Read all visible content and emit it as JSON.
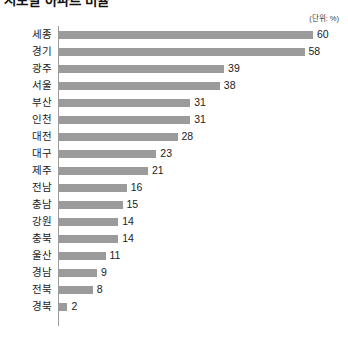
{
  "title": "시도별 아파트 비율",
  "unit_label": "(단위: %)",
  "axis": {
    "baseline_value": 0,
    "max_value": 60
  },
  "colors": {
    "bar": "#9b9b9b",
    "axis": "#9a9a9a",
    "text": "#1b1b1b",
    "background": "#ffffff"
  },
  "chart_data": {
    "type": "bar",
    "orientation": "horizontal",
    "title": "시도별 아파트 비율",
    "xlabel": "",
    "ylabel": "",
    "unit": "%",
    "grid": false,
    "legend": false,
    "xlim": [
      0,
      60
    ],
    "categories": [
      "세종",
      "경기",
      "광주",
      "서울",
      "부산",
      "인천",
      "대전",
      "대구",
      "제주",
      "전남",
      "충남",
      "강원",
      "충북",
      "울산",
      "경남",
      "전북",
      "경북"
    ],
    "values": [
      60,
      58,
      39,
      38,
      31,
      31,
      28,
      23,
      21,
      16,
      15,
      14,
      14,
      11,
      9,
      8,
      2
    ],
    "rows": [
      {
        "label": "세종",
        "value": 60
      },
      {
        "label": "경기",
        "value": 58
      },
      {
        "label": "광주",
        "value": 39
      },
      {
        "label": "서울",
        "value": 38
      },
      {
        "label": "부산",
        "value": 31
      },
      {
        "label": "인천",
        "value": 31
      },
      {
        "label": "대전",
        "value": 28
      },
      {
        "label": "대구",
        "value": 23
      },
      {
        "label": "제주",
        "value": 21
      },
      {
        "label": "전남",
        "value": 16
      },
      {
        "label": "충남",
        "value": 15
      },
      {
        "label": "강원",
        "value": 14
      },
      {
        "label": "충북",
        "value": 14
      },
      {
        "label": "울산",
        "value": 11
      },
      {
        "label": "경남",
        "value": 9
      },
      {
        "label": "전북",
        "value": 8
      },
      {
        "label": "경북",
        "value": 2
      }
    ]
  }
}
